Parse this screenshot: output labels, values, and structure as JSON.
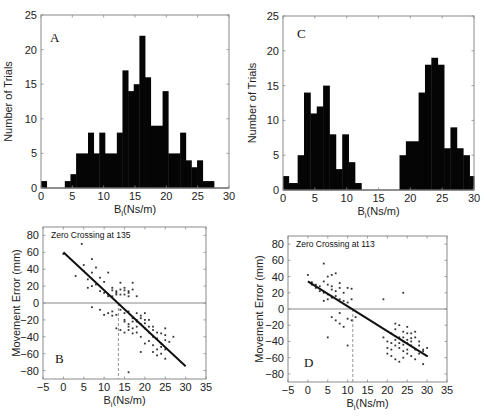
{
  "chart_data": [
    {
      "panel": "A",
      "type": "bar",
      "title": "",
      "xlabel": "B_i(Ns/m)",
      "ylabel": "Number of Trials",
      "xlim": [
        0,
        30
      ],
      "ylim": [
        0,
        25
      ],
      "xticks": [
        0,
        5,
        10,
        15,
        20,
        25,
        30
      ],
      "yticks": [
        0,
        5,
        10,
        15,
        20,
        25
      ],
      "bins": [
        {
          "x0": 0.0,
          "x1": 0.9,
          "count": 1
        },
        {
          "x0": 0.9,
          "x1": 3.8,
          "count": 0
        },
        {
          "x0": 3.8,
          "x1": 4.7,
          "count": 1
        },
        {
          "x0": 4.7,
          "x1": 5.6,
          "count": 2
        },
        {
          "x0": 5.6,
          "x1": 7.5,
          "count": 5
        },
        {
          "x0": 7.5,
          "x1": 8.4,
          "count": 8
        },
        {
          "x0": 8.4,
          "x1": 9.3,
          "count": 5
        },
        {
          "x0": 9.3,
          "x1": 10.2,
          "count": 8
        },
        {
          "x0": 10.2,
          "x1": 12.1,
          "count": 5
        },
        {
          "x0": 12.1,
          "x1": 13.0,
          "count": 8
        },
        {
          "x0": 13.0,
          "x1": 13.9,
          "count": 17
        },
        {
          "x0": 13.9,
          "x1": 14.8,
          "count": 14
        },
        {
          "x0": 14.8,
          "x1": 15.7,
          "count": 15
        },
        {
          "x0": 15.7,
          "x1": 16.6,
          "count": 22
        },
        {
          "x0": 16.6,
          "x1": 17.5,
          "count": 16
        },
        {
          "x0": 17.5,
          "x1": 19.4,
          "count": 9
        },
        {
          "x0": 19.4,
          "x1": 20.3,
          "count": 14
        },
        {
          "x0": 20.3,
          "x1": 22.2,
          "count": 5
        },
        {
          "x0": 22.2,
          "x1": 23.1,
          "count": 8
        },
        {
          "x0": 23.1,
          "x1": 24.0,
          "count": 4
        },
        {
          "x0": 24.0,
          "x1": 24.9,
          "count": 3
        },
        {
          "x0": 24.9,
          "x1": 25.8,
          "count": 4
        },
        {
          "x0": 25.8,
          "x1": 27.6,
          "count": 1
        }
      ]
    },
    {
      "panel": "C",
      "type": "bar",
      "title": "",
      "xlabel": "B_i(Ns/m)",
      "ylabel": "Number of Trials",
      "xlim": [
        0,
        30
      ],
      "ylim": [
        0,
        25
      ],
      "xticks": [
        0,
        5,
        10,
        15,
        20,
        25,
        30
      ],
      "yticks": [
        0,
        5,
        10,
        15,
        20,
        25
      ],
      "bins": [
        {
          "x0": 0.0,
          "x1": 0.9,
          "count": 2
        },
        {
          "x0": 0.9,
          "x1": 2.3,
          "count": 1
        },
        {
          "x0": 2.3,
          "x1": 3.3,
          "count": 5
        },
        {
          "x0": 3.3,
          "x1": 4.3,
          "count": 14
        },
        {
          "x0": 4.3,
          "x1": 5.3,
          "count": 11
        },
        {
          "x0": 5.3,
          "x1": 6.3,
          "count": 12
        },
        {
          "x0": 6.3,
          "x1": 7.3,
          "count": 15
        },
        {
          "x0": 7.3,
          "x1": 8.3,
          "count": 8
        },
        {
          "x0": 8.3,
          "x1": 9.3,
          "count": 3
        },
        {
          "x0": 9.3,
          "x1": 10.3,
          "count": 8
        },
        {
          "x0": 10.3,
          "x1": 11.3,
          "count": 4
        },
        {
          "x0": 11.3,
          "x1": 12.3,
          "count": 1
        },
        {
          "x0": 12.3,
          "x1": 18.3,
          "count": 0
        },
        {
          "x0": 18.3,
          "x1": 19.3,
          "count": 5
        },
        {
          "x0": 19.3,
          "x1": 21.3,
          "count": 7
        },
        {
          "x0": 21.3,
          "x1": 22.3,
          "count": 14
        },
        {
          "x0": 22.3,
          "x1": 23.3,
          "count": 18
        },
        {
          "x0": 23.3,
          "x1": 24.3,
          "count": 19
        },
        {
          "x0": 24.3,
          "x1": 25.3,
          "count": 18
        },
        {
          "x0": 25.3,
          "x1": 26.3,
          "count": 6
        },
        {
          "x0": 26.3,
          "x1": 27.3,
          "count": 9
        },
        {
          "x0": 27.3,
          "x1": 28.3,
          "count": 6
        },
        {
          "x0": 28.3,
          "x1": 29.3,
          "count": 5
        },
        {
          "x0": 29.3,
          "x1": 30.0,
          "count": 2
        }
      ]
    },
    {
      "panel": "B",
      "type": "scatter",
      "title": "",
      "annotation": "Zero Crossing at 135",
      "xlabel": "B_i(Ns/m)",
      "ylabel": "Movement Error (mm)",
      "xlim": [
        -5,
        35
      ],
      "ylim": [
        -90,
        90
      ],
      "xticks": [
        -5,
        0,
        5,
        10,
        15,
        20,
        25,
        30,
        35
      ],
      "yticks": [
        80,
        60,
        40,
        20,
        0,
        -20,
        -40,
        -60,
        -80
      ],
      "fit_line": {
        "x": [
          0,
          30
        ],
        "y": [
          60,
          -75
        ]
      },
      "zero_crossing_x": 13.5,
      "points": [
        [
          4.5,
          70
        ],
        [
          0,
          58
        ],
        [
          5,
          45
        ],
        [
          7,
          52
        ],
        [
          8,
          42
        ],
        [
          3,
          32
        ],
        [
          5,
          38
        ],
        [
          6,
          28
        ],
        [
          7,
          36
        ],
        [
          8,
          22
        ],
        [
          9,
          30
        ],
        [
          10,
          25
        ],
        [
          11,
          36
        ],
        [
          6,
          18
        ],
        [
          7,
          20
        ],
        [
          9,
          14
        ],
        [
          10,
          12
        ],
        [
          11,
          10
        ],
        [
          12,
          15
        ],
        [
          12,
          18
        ],
        [
          13,
          12
        ],
        [
          13,
          14
        ],
        [
          14,
          24
        ],
        [
          14,
          16
        ],
        [
          15,
          10
        ],
        [
          15,
          15
        ],
        [
          16,
          12
        ],
        [
          16,
          14
        ],
        [
          17,
          16
        ],
        [
          17,
          24
        ],
        [
          18,
          8
        ],
        [
          13,
          10
        ],
        [
          12,
          8
        ],
        [
          11,
          8
        ],
        [
          14,
          10
        ],
        [
          15,
          18
        ],
        [
          16,
          8
        ],
        [
          7,
          -5
        ],
        [
          9,
          -8
        ],
        [
          10,
          -14
        ],
        [
          12,
          -10
        ],
        [
          13,
          -14
        ],
        [
          14,
          -8
        ],
        [
          15,
          -20
        ],
        [
          15,
          -22
        ],
        [
          16,
          -25
        ],
        [
          16,
          -32
        ],
        [
          17,
          -18
        ],
        [
          17,
          -22
        ],
        [
          18,
          -20
        ],
        [
          18,
          -28
        ],
        [
          19,
          -15
        ],
        [
          19,
          -25
        ],
        [
          20,
          -30
        ],
        [
          20,
          -24
        ],
        [
          21,
          -20
        ],
        [
          21,
          -28
        ],
        [
          22,
          -32
        ],
        [
          18,
          -35
        ],
        [
          17,
          -36
        ],
        [
          19,
          -40
        ],
        [
          20,
          -48
        ],
        [
          21,
          -45
        ],
        [
          22,
          -50
        ],
        [
          22,
          -58
        ],
        [
          23,
          -42
        ],
        [
          23,
          -55
        ],
        [
          24,
          -48
        ],
        [
          24,
          -60
        ],
        [
          25,
          -38
        ],
        [
          25,
          -30
        ],
        [
          25,
          -55
        ],
        [
          27,
          -40
        ],
        [
          19,
          -58
        ],
        [
          16,
          -82
        ],
        [
          14,
          -32
        ],
        [
          15,
          -35
        ],
        [
          16,
          -28
        ],
        [
          17,
          -30
        ],
        [
          18,
          -22
        ],
        [
          19,
          -18
        ],
        [
          20,
          -12
        ],
        [
          16,
          -10
        ],
        [
          15,
          -12
        ],
        [
          13,
          -30
        ],
        [
          18,
          -12
        ],
        [
          20,
          -20
        ],
        [
          21,
          -35
        ],
        [
          22,
          -28
        ],
        [
          23,
          -35
        ],
        [
          24,
          -36
        ],
        [
          25,
          -44
        ],
        [
          22,
          -40
        ],
        [
          24,
          -52
        ],
        [
          26,
          -46
        ],
        [
          23,
          -62
        ],
        [
          25,
          -66
        ],
        [
          12,
          -15
        ],
        [
          11,
          -12
        ]
      ]
    },
    {
      "panel": "D",
      "type": "scatter",
      "title": "",
      "annotation": "Zero Crossing at 113",
      "xlabel": "B_i(Ns/m)",
      "ylabel": "Movement Error (mm)",
      "xlim": [
        -5,
        35
      ],
      "ylim": [
        -90,
        90
      ],
      "xticks": [
        -5,
        0,
        5,
        10,
        15,
        20,
        25,
        30,
        35
      ],
      "yticks": [
        80,
        60,
        40,
        20,
        0,
        -20,
        -40,
        -60,
        -80
      ],
      "fit_line": {
        "x": [
          0,
          30
        ],
        "y": [
          34,
          -58
        ]
      },
      "zero_crossing_x": 11.3,
      "points": [
        [
          4,
          56
        ],
        [
          0,
          42
        ],
        [
          1,
          33
        ],
        [
          2,
          30
        ],
        [
          3,
          28
        ],
        [
          4,
          34
        ],
        [
          5,
          40
        ],
        [
          6,
          42
        ],
        [
          7,
          44
        ],
        [
          3,
          22
        ],
        [
          4,
          20
        ],
        [
          5,
          18
        ],
        [
          6,
          24
        ],
        [
          7,
          22
        ],
        [
          8,
          26
        ],
        [
          9,
          20
        ],
        [
          10,
          26
        ],
        [
          11,
          25
        ],
        [
          4,
          10
        ],
        [
          5,
          12
        ],
        [
          6,
          14
        ],
        [
          7,
          16
        ],
        [
          8,
          12
        ],
        [
          9,
          10
        ],
        [
          10,
          8
        ],
        [
          11,
          12
        ],
        [
          5,
          30
        ],
        [
          6,
          28
        ],
        [
          8,
          32
        ],
        [
          2,
          26
        ],
        [
          1,
          30
        ],
        [
          6,
          -10
        ],
        [
          7,
          -14
        ],
        [
          8,
          -18
        ],
        [
          9,
          -22
        ],
        [
          10,
          -12
        ],
        [
          11,
          -14
        ],
        [
          12,
          -10
        ],
        [
          10,
          -45
        ],
        [
          5,
          -35
        ],
        [
          8,
          -5
        ],
        [
          19,
          12
        ],
        [
          24,
          20
        ],
        [
          19,
          -35
        ],
        [
          20,
          -40
        ],
        [
          21,
          -30
        ],
        [
          22,
          -25
        ],
        [
          22,
          -18
        ],
        [
          23,
          -20
        ],
        [
          24,
          -28
        ],
        [
          25,
          -22
        ],
        [
          23,
          -35
        ],
        [
          24,
          -40
        ],
        [
          25,
          -38
        ],
        [
          26,
          -30
        ],
        [
          27,
          -35
        ],
        [
          28,
          -40
        ],
        [
          22,
          -45
        ],
        [
          23,
          -48
        ],
        [
          24,
          -52
        ],
        [
          25,
          -55
        ],
        [
          26,
          -45
        ],
        [
          27,
          -50
        ],
        [
          28,
          -55
        ],
        [
          29,
          -50
        ],
        [
          30,
          -48
        ],
        [
          20,
          -55
        ],
        [
          21,
          -58
        ],
        [
          22,
          -62
        ],
        [
          23,
          -65
        ],
        [
          24,
          -60
        ],
        [
          25,
          -50
        ],
        [
          26,
          -58
        ],
        [
          27,
          -62
        ],
        [
          29,
          -68
        ],
        [
          21,
          -42
        ],
        [
          22,
          -38
        ],
        [
          23,
          -42
        ],
        [
          24,
          -44
        ],
        [
          25,
          -42
        ],
        [
          26,
          -40
        ],
        [
          24,
          -35
        ],
        [
          25,
          -30
        ],
        [
          26,
          -36
        ],
        [
          27,
          -28
        ],
        [
          28,
          -45
        ],
        [
          29,
          -52
        ],
        [
          30,
          -58
        ],
        [
          20,
          -48
        ],
        [
          21,
          -50
        ]
      ]
    }
  ]
}
